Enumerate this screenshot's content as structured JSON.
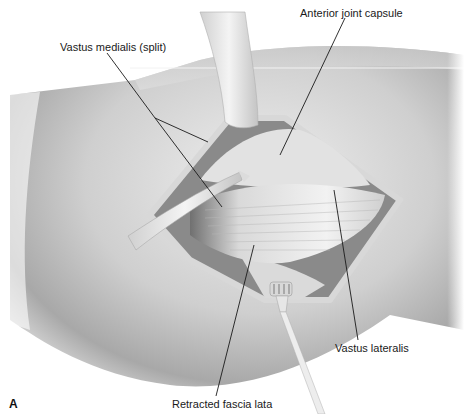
{
  "figure": {
    "panel_letter": "A",
    "labels": {
      "vastus_medialis": "Vastus medialis (split)",
      "anterior_joint_capsule": "Anterior joint capsule",
      "vastus_lateralis": "Vastus lateralis",
      "retracted_fascia_lata": "Retracted fascia lata"
    },
    "colors": {
      "background": "#ffffff",
      "skin_light": "#e6e6e6",
      "skin_mid": "#bdbdbd",
      "skin_dark": "#8f8f8f",
      "leader_line": "#1a1a1a",
      "retractor": "#ececec"
    }
  }
}
